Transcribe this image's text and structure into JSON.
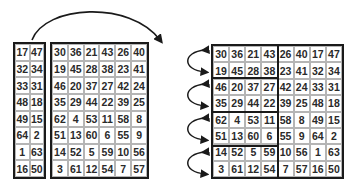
{
  "diagram": {
    "left_block_2col": [
      [
        "17",
        "47"
      ],
      [
        "32",
        "34"
      ],
      [
        "33",
        "31"
      ],
      [
        "48",
        "18"
      ],
      [
        "49",
        "15"
      ],
      [
        "64",
        "2"
      ],
      [
        "1",
        "63"
      ],
      [
        "16",
        "50"
      ]
    ],
    "left_block_6col": [
      [
        "30",
        "36",
        "21",
        "43",
        "26",
        "40"
      ],
      [
        "19",
        "45",
        "28",
        "38",
        "23",
        "41"
      ],
      [
        "46",
        "20",
        "37",
        "27",
        "42",
        "24"
      ],
      [
        "35",
        "29",
        "44",
        "22",
        "39",
        "25"
      ],
      [
        "62",
        "4",
        "53",
        "11",
        "58",
        "8"
      ],
      [
        "51",
        "13",
        "60",
        "6",
        "55",
        "9"
      ],
      [
        "14",
        "52",
        "5",
        "59",
        "10",
        "56"
      ],
      [
        "3",
        "61",
        "12",
        "54",
        "7",
        "57"
      ]
    ],
    "right_matrix": [
      [
        "30",
        "36",
        "21",
        "43",
        "26",
        "40",
        "17",
        "47"
      ],
      [
        "19",
        "45",
        "28",
        "38",
        "23",
        "41",
        "32",
        "34"
      ],
      [
        "46",
        "20",
        "37",
        "27",
        "42",
        "24",
        "33",
        "31"
      ],
      [
        "35",
        "29",
        "44",
        "22",
        "39",
        "25",
        "48",
        "18"
      ],
      [
        "62",
        "4",
        "53",
        "11",
        "58",
        "8",
        "49",
        "15"
      ],
      [
        "51",
        "13",
        "60",
        "6",
        "55",
        "9",
        "64",
        "2"
      ],
      [
        "14",
        "52",
        "5",
        "59",
        "10",
        "56",
        "1",
        "63"
      ],
      [
        "3",
        "61",
        "12",
        "54",
        "7",
        "57",
        "16",
        "50"
      ]
    ],
    "arrows": {
      "top_arc": "move-first-two-columns-to-end",
      "swap_arrows": [
        "rows-1-2",
        "rows-3-4",
        "rows-5-6",
        "rows-7-8"
      ]
    },
    "colors": {
      "border": "#1a1a1a",
      "cell_border": "#b5b5b5",
      "text": "#2a2a2a"
    }
  }
}
